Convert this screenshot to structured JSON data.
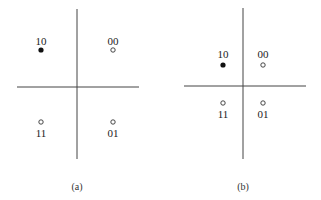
{
  "diagrams": [
    {
      "caption": "(a)",
      "points": [
        {
          "label": "10",
          "filled": true
        },
        {
          "label": "00",
          "filled": false
        },
        {
          "label": "11",
          "filled": false
        },
        {
          "label": "01",
          "filled": false
        }
      ]
    },
    {
      "caption": "(b)",
      "points": [
        {
          "label": "10",
          "filled": true
        },
        {
          "label": "00",
          "filled": false
        },
        {
          "label": "11",
          "filled": false
        },
        {
          "label": "01",
          "filled": false
        }
      ]
    }
  ],
  "colors": {
    "line": "#333333",
    "point_fill": "#111111",
    "point_hollow": "#ffffff"
  }
}
